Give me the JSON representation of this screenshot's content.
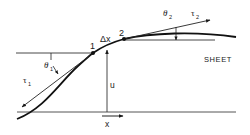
{
  "diagram": {
    "labels": {
      "point1": "1",
      "point2": "2",
      "delta_x": "Δx",
      "theta1": "θ",
      "theta1_sub": "1",
      "theta2": "θ",
      "theta2_sub": "2",
      "tau1": "τ",
      "tau1_sub": "1",
      "tau2": "τ",
      "tau2_sub": "2",
      "displacement": "u",
      "axis_x": "x",
      "sheet": "SHEET"
    },
    "colors": {
      "ink": "#1a1a1a",
      "background": "#ffffff"
    }
  }
}
